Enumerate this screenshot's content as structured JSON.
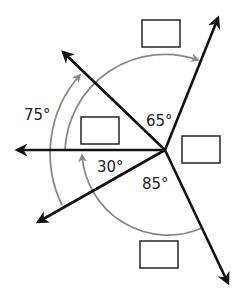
{
  "diagram": {
    "angle_labels": [
      {
        "id": "upper-right",
        "text": "65°"
      },
      {
        "id": "upper-left-span",
        "text": "75°"
      },
      {
        "id": "lower-left",
        "text": "30°"
      },
      {
        "id": "lower-span",
        "text": "85°"
      }
    ],
    "answer_boxes": [
      {
        "id": "top",
        "value": ""
      },
      {
        "id": "left",
        "value": ""
      },
      {
        "id": "right",
        "value": ""
      },
      {
        "id": "bottom",
        "value": ""
      }
    ],
    "colors": {
      "ray": "#111111",
      "arc": "#888888",
      "text": "#222222"
    }
  }
}
